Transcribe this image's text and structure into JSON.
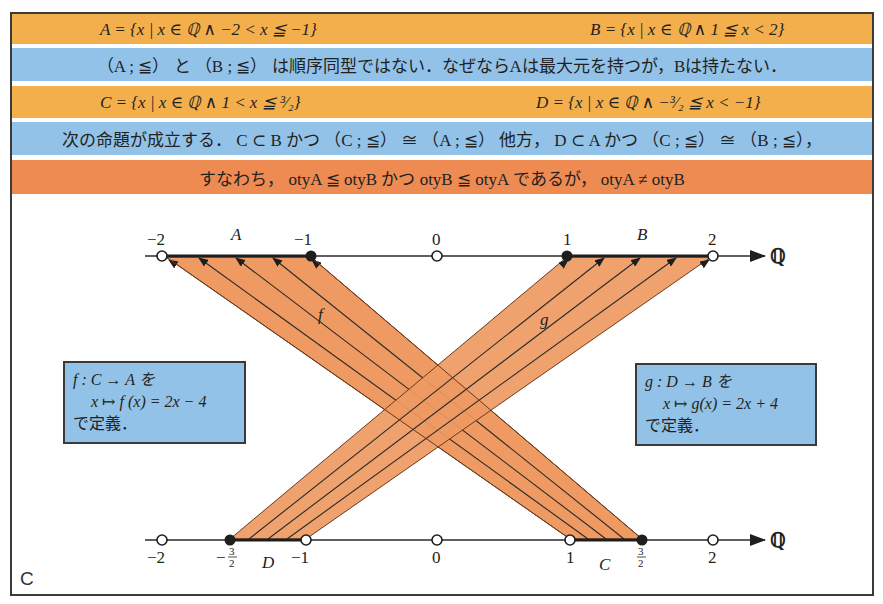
{
  "rows": {
    "row1": {
      "left": "A = {x | x ∈ ℚ ∧ −2 < x ≦ −1}",
      "right": "B = {x | x ∈ ℚ ∧ 1 ≦ x < 2}"
    },
    "row2": {
      "text": "（A ; ≦） と （B ; ≦） は順序同型ではない．なぜならAは最大元を持つが，Bは持たない．"
    },
    "row3": {
      "left": "C = {x | x ∈ ℚ ∧ 1 < x ≦ ³⁄₂}",
      "right": "D = {x | x ∈ ℚ ∧ −³⁄₂ ≦ x < −1}"
    },
    "row4": {
      "text": "次の命題が成立する． C ⊂ B かつ （C ; ≦） ≅ （A ; ≦） 他方， D ⊂ A かつ （C ; ≦） ≅ （B ; ≦），"
    },
    "row5": {
      "text": "すなわち， otyA ≦ otyB かつ otyB ≦ otyA であるが， otyA ≠ otyB"
    }
  },
  "colors": {
    "orange_band": "#F3AF4B",
    "blue_band": "#93C2E8",
    "deep_orange_band": "#EE8B52",
    "mapping_fill": "#EE9A62",
    "line": "#2a2a2a"
  },
  "diagram": {
    "top_axis": {
      "ticks": [
        {
          "label": "−2",
          "x": 162,
          "type": "open"
        },
        {
          "label": "−1",
          "x": 311,
          "type": "closed"
        },
        {
          "label": "0",
          "x": 437,
          "type": "open"
        },
        {
          "label": "1",
          "x": 567,
          "type": "closed"
        },
        {
          "label": "2",
          "x": 713,
          "type": "open"
        }
      ],
      "set_labels": [
        {
          "label": "A",
          "x": 236
        },
        {
          "label": "B",
          "x": 642
        }
      ],
      "axis_label": "ℚ"
    },
    "bottom_axis": {
      "ticks": [
        {
          "label": "−2",
          "x": 162,
          "type": "open"
        },
        {
          "label": "−3/2",
          "x": 230,
          "type": "closed"
        },
        {
          "label": "−1",
          "x": 306,
          "type": "open"
        },
        {
          "label": "0",
          "x": 437,
          "type": "open"
        },
        {
          "label": "1",
          "x": 570,
          "type": "open"
        },
        {
          "label": "3/2",
          "x": 642,
          "type": "closed"
        },
        {
          "label": "2",
          "x": 713,
          "type": "open"
        }
      ],
      "set_labels": [
        {
          "label": "D",
          "x": 268
        },
        {
          "label": "C",
          "x": 605
        }
      ],
      "axis_label": "ℚ"
    },
    "maps": {
      "f_label": "f",
      "g_label": "g"
    },
    "corner_label": "C"
  },
  "boxes": {
    "f_box": {
      "line1": "f : C → A を",
      "line2": "x ↦ f (x) = 2x − 4",
      "line3": "で定義．"
    },
    "g_box": {
      "line1": "g : D → B を",
      "line2": "x ↦ g(x) = 2x + 4",
      "line3": "で定義．"
    }
  }
}
